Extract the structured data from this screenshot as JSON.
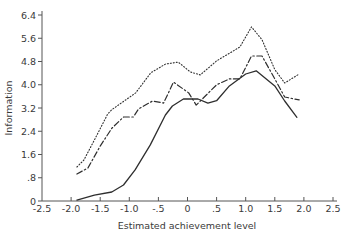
{
  "chart_data": {
    "type": "line",
    "title": "",
    "xlabel": "Estimated achievement level",
    "ylabel": "Information",
    "xlim": [
      -2.5,
      2.5
    ],
    "ylim": [
      0,
      6.4
    ],
    "grid": false,
    "legend": null,
    "x_ticks": [
      -2.5,
      -2.0,
      -1.5,
      -1.0,
      -0.5,
      0,
      0.5,
      1.0,
      1.5,
      2.0,
      2.5
    ],
    "x_tick_labels": [
      "-2.5",
      "-2.0",
      "-1.5",
      "-1.0",
      "-.5",
      "0",
      ".5",
      "1.0",
      "1.5",
      "2.0",
      "2.5"
    ],
    "y_ticks": [
      0,
      0.8,
      1.6,
      2.4,
      3.2,
      4.0,
      4.8,
      5.6,
      6.4
    ],
    "y_tick_labels": [
      "0",
      ".8",
      "1.6",
      "2.4",
      "3.2",
      "4.0",
      "4.8",
      "5.6",
      "6.4"
    ],
    "series": [
      {
        "name": "dotted",
        "line_style": "dotted",
        "x": [
          -1.9,
          -1.78,
          -1.6,
          -1.37,
          -1.3,
          -0.89,
          -0.63,
          -0.38,
          -0.16,
          0.05,
          0.22,
          0.5,
          0.9,
          1.1,
          1.28,
          1.5,
          1.67,
          1.92
        ],
        "y": [
          1.17,
          1.41,
          2.1,
          3.0,
          3.14,
          3.72,
          4.41,
          4.71,
          4.78,
          4.44,
          4.34,
          4.82,
          5.3,
          5.99,
          5.55,
          4.52,
          4.06,
          4.37
        ]
      },
      {
        "name": "dash-dot",
        "line_style": "dashdot",
        "x": [
          -1.9,
          -1.71,
          -1.5,
          -1.3,
          -1.1,
          -0.93,
          -0.84,
          -0.6,
          -0.41,
          -0.24,
          0.02,
          0.15,
          0.5,
          0.72,
          0.9,
          1.1,
          1.28,
          1.5,
          1.67,
          1.92
        ],
        "y": [
          0.93,
          1.14,
          1.89,
          2.5,
          2.89,
          2.89,
          3.17,
          3.44,
          3.37,
          4.09,
          3.72,
          3.3,
          4.0,
          4.2,
          4.2,
          4.99,
          4.99,
          4.2,
          3.58,
          3.48
        ]
      },
      {
        "name": "solid",
        "line_style": "solid",
        "x": [
          -1.9,
          -1.6,
          -1.3,
          -1.1,
          -0.9,
          -0.64,
          -0.38,
          -0.26,
          -0.07,
          0.18,
          0.35,
          0.5,
          0.72,
          1.0,
          1.18,
          1.5,
          1.67,
          1.88
        ],
        "y": [
          0.03,
          0.2,
          0.31,
          0.55,
          1.07,
          1.93,
          2.96,
          3.27,
          3.51,
          3.51,
          3.37,
          3.45,
          3.96,
          4.37,
          4.48,
          3.96,
          3.44,
          2.88
        ]
      }
    ]
  },
  "layout": {
    "plot_left": 42,
    "plot_right": 333,
    "plot_top": 15,
    "plot_bottom": 201,
    "ink_color": "#2e2e2e"
  }
}
